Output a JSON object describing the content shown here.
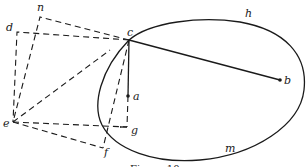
{
  "diagram": {
    "labels": {
      "n": "n",
      "d": "d",
      "c": "c",
      "h": "h",
      "b": "b",
      "a": "a",
      "e": "e",
      "g": "g",
      "f": "f",
      "m": "m"
    },
    "caption": "Figure 10",
    "colors": {
      "ink": "#1a1a1a",
      "background": "#ffffff"
    }
  }
}
